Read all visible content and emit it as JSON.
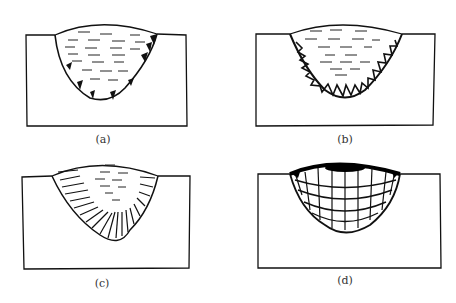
{
  "figure": {
    "panels": [
      {
        "id": "a",
        "label": "(a)",
        "description": "weld pool with small dark nuclei at fusion boundary"
      },
      {
        "id": "b",
        "label": "(b)",
        "description": "weld pool with triangular dendrite teeth along fusion line"
      },
      {
        "id": "c",
        "label": "(c)",
        "description": "columnar grains radiating from fusion line toward center"
      },
      {
        "id": "d",
        "label": "(d)",
        "description": "layered columnar grain growth with successive fusion bands"
      }
    ]
  }
}
